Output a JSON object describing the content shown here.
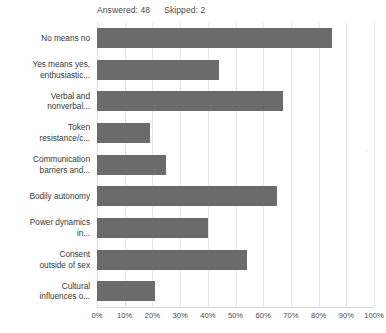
{
  "header": {
    "answered_label": "Answered: 48",
    "skipped_label": "Skipped: 2"
  },
  "axis": {
    "tick_labels": [
      "0%",
      "10%",
      "20%",
      "30%",
      "40%",
      "50%",
      "60%",
      "70%",
      "80%",
      "90%",
      "100%"
    ]
  },
  "colors": {
    "bar": "#6b6b6b",
    "gridline": "#e8e8e8",
    "text": "#3a3a3a"
  },
  "chart_data": {
    "type": "bar",
    "orientation": "horizontal",
    "title": "",
    "xlabel": "",
    "ylabel": "",
    "xlim": [
      0,
      100
    ],
    "grid": true,
    "legend": "none",
    "categories": [
      "No means no",
      "Yes means yes, enthusiastic...",
      "Verbal and nonverbal...",
      "Token resistance/c...",
      "Communication barriers and...",
      "Bodily autonomy",
      "Power dynamics in...",
      "Consent outside of sex",
      "Cultural influences o..."
    ],
    "category_lines": [
      [
        "No means no"
      ],
      [
        "Yes means yes,",
        "enthusiastic..."
      ],
      [
        "Verbal and",
        "nonverbal..."
      ],
      [
        "Token",
        "resistance/c..."
      ],
      [
        "Communication",
        "barriers and..."
      ],
      [
        "Bodily autonomy"
      ],
      [
        "Power dynamics",
        "in..."
      ],
      [
        "Consent",
        "outside of sex"
      ],
      [
        "Cultural",
        "influences o..."
      ]
    ],
    "values": [
      85,
      44,
      67,
      19,
      25,
      65,
      40,
      54,
      21
    ],
    "value_unit": "%"
  }
}
